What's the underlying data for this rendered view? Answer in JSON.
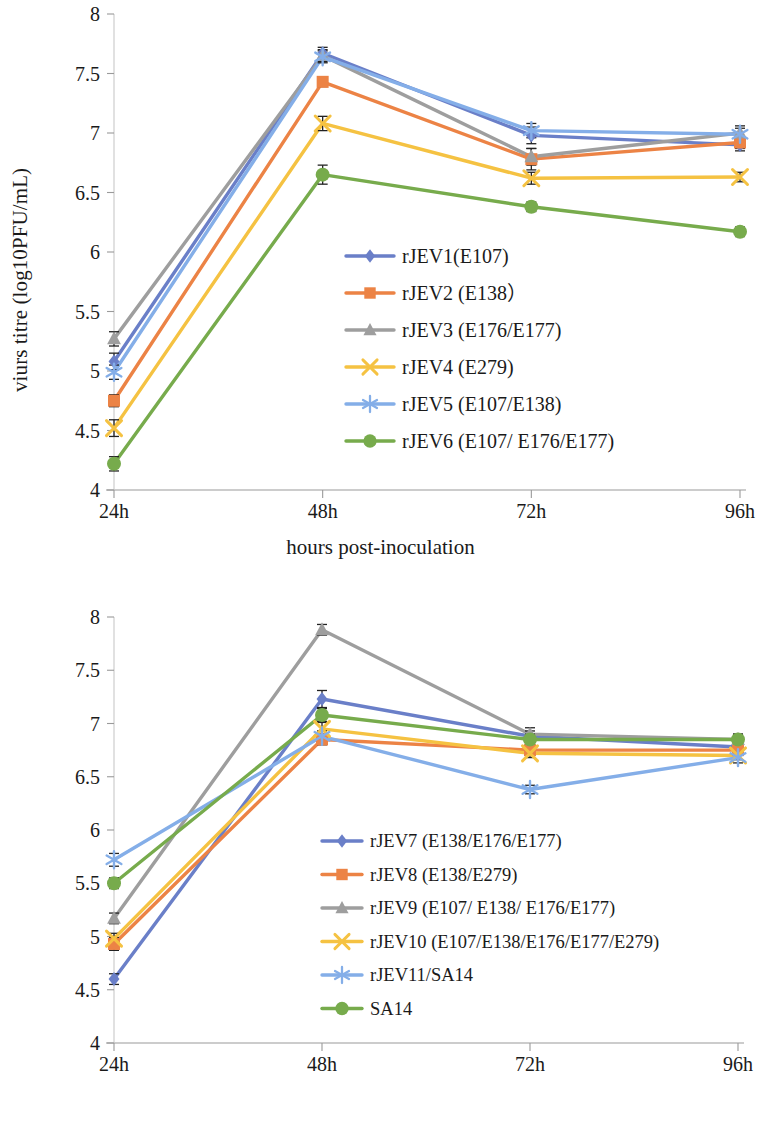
{
  "figures": [
    {
      "id": "figure-1",
      "axis": {
        "ylabel": "viurs titre (log10PFU/mL)",
        "ylabel_has_subscript": false,
        "xlabel": "hours post-inoculation",
        "yticks": [
          "4",
          "4.5",
          "5",
          "5.5",
          "6",
          "6.5",
          "7",
          "7.5",
          "8"
        ],
        "xticks": [
          "24h",
          "48h",
          "72h",
          "96h"
        ]
      },
      "chart_data": {
        "type": "line",
        "title": "",
        "xlabel": "hours post-inoculation",
        "ylabel": "viurs titre (log10PFU/mL)",
        "categories": [
          "24h",
          "48h",
          "72h",
          "96h"
        ],
        "ylim": [
          4,
          8
        ],
        "ytick_step": 0.5,
        "grid": false,
        "legend_position": "inside-center",
        "series": [
          {
            "name": "rJEV1(E107)",
            "color": "#6a7fc8",
            "marker": "diamond",
            "values": [
              5.08,
              7.67,
              6.98,
              6.9
            ],
            "errors": [
              0.07,
              0.05,
              0.07,
              0.05
            ]
          },
          {
            "name": "rJEV2 (E138）",
            "color": "#ec8345",
            "marker": "square",
            "values": [
              4.75,
              7.43,
              6.78,
              6.92
            ],
            "errors": [
              0.05,
              0.04,
              0.09,
              0.05
            ]
          },
          {
            "name": "rJEV3 (E176/E177)",
            "color": "#9e9e9e",
            "marker": "triangle",
            "values": [
              5.27,
              7.65,
              6.8,
              7.0
            ],
            "errors": [
              0.06,
              0.05,
              0.07,
              0.06
            ]
          },
          {
            "name": "rJEV4 (E279)",
            "color": "#f5c242",
            "marker": "cross",
            "values": [
              4.52,
              7.08,
              6.62,
              6.63
            ],
            "errors": [
              0.07,
              0.06,
              0.05,
              0.04
            ]
          },
          {
            "name": "rJEV5 (E107/E138)",
            "color": "#84aee8",
            "marker": "asterisk",
            "values": [
              4.99,
              7.64,
              7.02,
              6.99
            ],
            "errors": [
              0.06,
              0.05,
              0.06,
              0.05
            ]
          },
          {
            "name": "rJEV6 (E107/ E176/E177)",
            "color": "#77ab4c",
            "marker": "circle",
            "values": [
              4.22,
              6.65,
              6.38,
              6.17
            ],
            "errors": [
              0.06,
              0.08,
              0.04,
              0.04
            ]
          }
        ]
      }
    },
    {
      "id": "figure-2",
      "axis": {
        "ylabel_pre": "virus titre (log",
        "ylabel_sub": "10",
        "ylabel_post": "PFU/mL)",
        "ylabel": "virus titre (log10PFU/mL)",
        "ylabel_has_subscript": true,
        "xlabel": "hours post-inoculation",
        "yticks": [
          "4",
          "4.5",
          "5",
          "5.5",
          "6",
          "6.5",
          "7",
          "7.5",
          "8"
        ],
        "xticks": [
          "24h",
          "48h",
          "72h",
          "96h"
        ]
      },
      "chart_data": {
        "type": "line",
        "title": "",
        "xlabel": "hours post-inoculation",
        "ylabel": "virus titre (log10PFU/mL)",
        "categories": [
          "24h",
          "48h",
          "72h",
          "96h"
        ],
        "ylim": [
          4,
          8
        ],
        "ytick_step": 0.5,
        "grid": false,
        "legend_position": "inside-center",
        "series": [
          {
            "name": "rJEV7 (E138/E176/E177)",
            "color": "#6a7fc8",
            "marker": "diamond",
            "values": [
              4.6,
              7.23,
              6.88,
              6.78
            ],
            "errors": [
              0.05,
              0.08,
              0.05,
              0.04
            ]
          },
          {
            "name": "rJEV8 (E138/E279)",
            "color": "#ec8345",
            "marker": "square",
            "values": [
              4.93,
              6.85,
              6.75,
              6.75
            ],
            "errors": [
              0.06,
              0.05,
              0.04,
              0.04
            ]
          },
          {
            "name": "rJEV9 (E107/ E138/ E176/E177)",
            "color": "#9e9e9e",
            "marker": "triangle",
            "values": [
              5.17,
              7.88,
              6.9,
              6.85
            ],
            "errors": [
              0.05,
              0.05,
              0.06,
              0.05
            ]
          },
          {
            "name": "rJEV10 (E107/E138/E176/E177/E279)",
            "color": "#f5c242",
            "marker": "cross",
            "values": [
              4.98,
              6.95,
              6.72,
              6.7
            ],
            "errors": [
              0.05,
              0.06,
              0.04,
              0.04
            ]
          },
          {
            "name": "rJEV11/SA14",
            "color": "#84aee8",
            "marker": "asterisk",
            "values": [
              5.72,
              6.88,
              6.38,
              6.68
            ],
            "errors": [
              0.06,
              0.05,
              0.04,
              0.05
            ]
          },
          {
            "name": "SA14",
            "color": "#77ab4c",
            "marker": "circle",
            "values": [
              5.5,
              7.08,
              6.85,
              6.85
            ],
            "errors": [
              0.05,
              0.06,
              0.05,
              0.05
            ]
          }
        ]
      }
    }
  ]
}
